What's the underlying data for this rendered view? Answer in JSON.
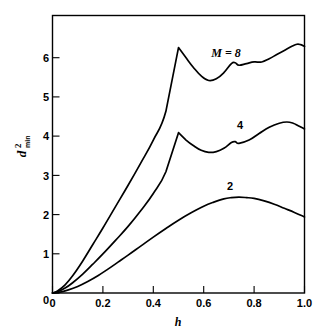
{
  "chart_data": {
    "type": "line",
    "title": "",
    "xlabel": "h",
    "ylabel": "d2min",
    "ylabel_parts": {
      "base": "d",
      "superscript": "2",
      "subscript": "min"
    },
    "xlim": [
      0,
      1.0
    ],
    "ylim": [
      0,
      6.75
    ],
    "grid": false,
    "legend": "inline-curve-labels",
    "xticks": [
      0,
      0.2,
      0.4,
      0.6,
      0.8,
      1.0
    ],
    "xticklabels": [
      "0",
      "0.2",
      "0.4",
      "0.6",
      "0.8",
      "1.0"
    ],
    "yticks": [
      0,
      1,
      2,
      3,
      4,
      5,
      6
    ],
    "yticklabels": [
      "0",
      "1",
      "2",
      "3",
      "4",
      "5",
      "6"
    ],
    "line_color": "#000000",
    "background_color": "#ffffff",
    "series": [
      {
        "name": "M = 8",
        "label_text": "M = 8",
        "label_x": 0.69,
        "label_y": 6.28,
        "x": [
          0.0,
          0.02,
          0.05,
          0.08,
          0.12,
          0.16,
          0.2,
          0.25,
          0.3,
          0.35,
          0.4,
          0.45,
          0.5,
          0.53,
          0.56,
          0.59,
          0.62,
          0.65,
          0.68,
          0.71,
          0.725,
          0.74,
          0.77,
          0.8,
          0.83,
          0.86,
          0.89,
          0.92,
          0.95,
          0.97,
          0.985,
          1.0
        ],
        "y": [
          0.0,
          0.05,
          0.2,
          0.42,
          0.78,
          1.18,
          1.58,
          2.1,
          2.62,
          3.16,
          3.72,
          4.42,
          5.97,
          5.72,
          5.48,
          5.28,
          5.17,
          5.21,
          5.36,
          5.58,
          5.6,
          5.54,
          5.58,
          5.62,
          5.62,
          5.7,
          5.8,
          5.9,
          6.0,
          6.05,
          6.04,
          6.0
        ]
      },
      {
        "name": "4",
        "label_text": "4",
        "label_x": 0.745,
        "label_y": 4.33,
        "x": [
          0.0,
          0.02,
          0.05,
          0.08,
          0.12,
          0.16,
          0.2,
          0.25,
          0.3,
          0.35,
          0.4,
          0.45,
          0.5,
          0.53,
          0.56,
          0.59,
          0.62,
          0.65,
          0.68,
          0.71,
          0.725,
          0.74,
          0.78,
          0.82,
          0.86,
          0.9,
          0.93,
          0.955,
          0.975,
          1.0
        ],
        "y": [
          0.0,
          0.03,
          0.12,
          0.25,
          0.46,
          0.7,
          0.95,
          1.28,
          1.62,
          2.0,
          2.42,
          2.95,
          3.9,
          3.72,
          3.58,
          3.47,
          3.42,
          3.44,
          3.52,
          3.66,
          3.68,
          3.64,
          3.72,
          3.88,
          4.03,
          4.13,
          4.16,
          4.13,
          4.07,
          3.99
        ]
      },
      {
        "name": "2",
        "label_text": "2",
        "label_x": 0.705,
        "label_y": 2.62,
        "x": [
          0.0,
          0.03,
          0.06,
          0.1,
          0.14,
          0.18,
          0.22,
          0.26,
          0.3,
          0.35,
          0.4,
          0.45,
          0.5,
          0.55,
          0.6,
          0.64,
          0.68,
          0.71,
          0.74,
          0.77,
          0.8,
          0.84,
          0.88,
          0.92,
          0.96,
          1.0
        ],
        "y": [
          0.0,
          0.02,
          0.07,
          0.16,
          0.28,
          0.42,
          0.58,
          0.75,
          0.92,
          1.14,
          1.36,
          1.57,
          1.77,
          1.95,
          2.11,
          2.21,
          2.29,
          2.32,
          2.33,
          2.32,
          2.3,
          2.24,
          2.16,
          2.06,
          1.96,
          1.85
        ]
      }
    ]
  },
  "axes": {
    "x_title": "h",
    "y_title_base": "d",
    "y_title_sup": "2",
    "y_title_sub": "min"
  }
}
